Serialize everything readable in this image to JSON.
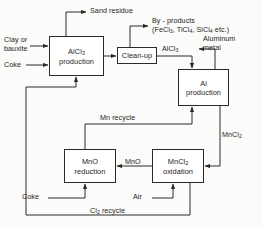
{
  "diagram": {
    "line_color": "#2a2a2a",
    "text_color": "#1d1d1d",
    "background": "#fbfbfa",
    "boxes": [
      {
        "id": "alcl3_production",
        "line1": "AlCl",
        "sub1": "3",
        "line2": "production"
      },
      {
        "id": "cleanup",
        "line1": "Clean-up",
        "sub1": "",
        "line2": ""
      },
      {
        "id": "al_production",
        "line1": "Al",
        "sub1": "",
        "line2": "production"
      },
      {
        "id": "mncl2_oxidation",
        "line1": "MnCl",
        "sub1": "2",
        "line2": "oxidation"
      },
      {
        "id": "mno_reduction",
        "line1": "MnO",
        "sub1": "",
        "line2": "reduction"
      }
    ],
    "labels": {
      "clay_or_bauxite": "Clay or\nbauxite",
      "clay_line1": "Clay or",
      "clay_line2": "bauxite",
      "coke_top": "Coke",
      "sand_residue": "Sand residue",
      "byproducts_line1": "By - products",
      "byproducts_line2_pre": "(FeCl",
      "byproducts_line2_a": "3",
      "byproducts_line2_mid": ", TiCl",
      "byproducts_line2_b": "4",
      "byproducts_line2_mid2": ", SiCl",
      "byproducts_line2_c": "4",
      "byproducts_line2_end": " etc.)",
      "alcl3_stream": "AlCl",
      "alcl3_stream_sub": "3",
      "aluminium_metal_line1": "Aluminum",
      "aluminium_metal_line2": "metal",
      "mn_recycle": "Mn recycle",
      "mncl2_stream": "MnCl",
      "mncl2_stream_sub": "2",
      "mno_stream": "MnO",
      "coke_bottom": "Coke",
      "air": "Air",
      "cl2_recycle_pre": "Cl",
      "cl2_recycle_sub": "2",
      "cl2_recycle_post": " recycle"
    }
  }
}
